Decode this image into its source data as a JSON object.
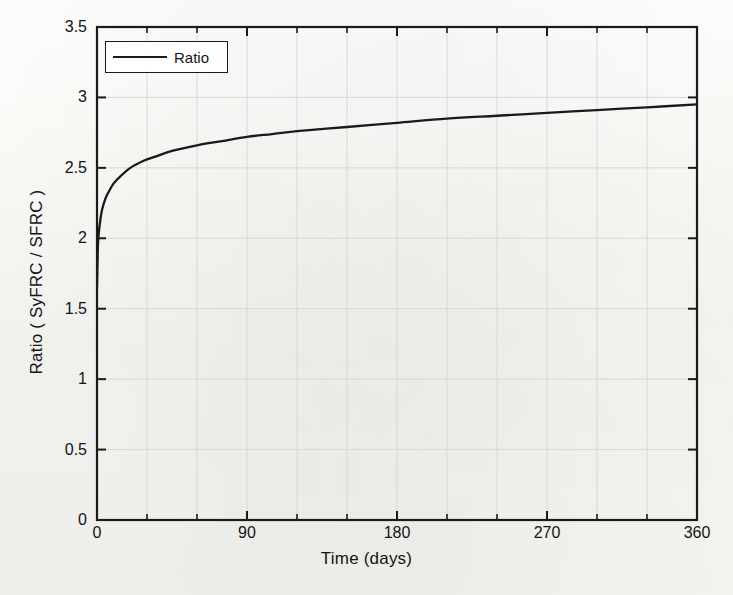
{
  "chart_data": {
    "type": "line",
    "title": "",
    "subtitle": "",
    "xlabel": "Time (days)",
    "ylabel": "Ratio ( SyFRC / SFRC )",
    "xlim": [
      0,
      360
    ],
    "ylim": [
      0,
      3.5
    ],
    "grid": true,
    "grid_style": "light gray gridlines at major and x-minor ticks",
    "legend": {
      "position": "upper left inside axes",
      "entries": [
        "Ratio"
      ]
    },
    "xticks": [
      0,
      90,
      180,
      270,
      360
    ],
    "xtick_labels": [
      "0",
      "90",
      "180",
      "270",
      "360"
    ],
    "xminor_ticks": [
      30,
      60,
      120,
      150,
      210,
      240,
      300,
      330
    ],
    "yticks": [
      0,
      0.5,
      1,
      1.5,
      2,
      2.5,
      3,
      3.5
    ],
    "ytick_labels": [
      "0",
      "0.5",
      "1",
      "1.5",
      "2",
      "2.5",
      "3",
      "3.5"
    ],
    "line_color": "#1a1a1a",
    "series": [
      {
        "name": "Ratio",
        "x": [
          0,
          0.5,
          1,
          2,
          3,
          5,
          7,
          10,
          14,
          20,
          28,
          35,
          45,
          60,
          75,
          90,
          105,
          120,
          150,
          180,
          210,
          240,
          270,
          300,
          330,
          360
        ],
        "y": [
          1.64,
          1.93,
          2.03,
          2.13,
          2.2,
          2.28,
          2.33,
          2.39,
          2.44,
          2.5,
          2.55,
          2.58,
          2.62,
          2.66,
          2.69,
          2.72,
          2.74,
          2.76,
          2.79,
          2.82,
          2.85,
          2.87,
          2.89,
          2.91,
          2.93,
          2.95
        ]
      }
    ]
  },
  "figure": {
    "legend_label": "Ratio",
    "axis": {
      "x_title": "Time (days)",
      "y_title": "Ratio ( SyFRC / SFRC )"
    }
  }
}
